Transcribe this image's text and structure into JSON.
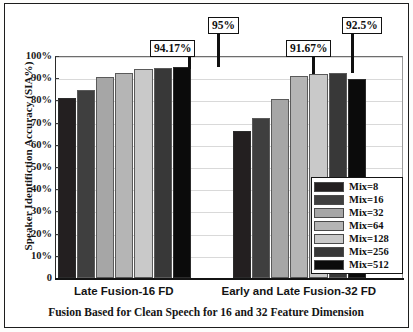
{
  "chart_data": {
    "type": "bar",
    "title": "",
    "xlabel": "Fusion Based for Clean Speech for 16 and 32 Feature Dimension",
    "ylabel": "Speaker Identifiction Accuracy (SIA%)",
    "categories": [
      "Late Fusion-16 FD",
      "Early and Late Fusion-32 FD"
    ],
    "series": [
      {
        "name": "Mix=8",
        "values": [
          81,
          66
        ]
      },
      {
        "name": "Mix=16",
        "values": [
          84.5,
          72
        ]
      },
      {
        "name": "Mix=32",
        "values": [
          90.5,
          80.5
        ]
      },
      {
        "name": "Mix=64",
        "values": [
          92.5,
          91.17
        ]
      },
      {
        "name": "Mix=128",
        "values": [
          94.17,
          92
        ]
      },
      {
        "name": "Mix=256",
        "values": [
          94.5,
          92.5
        ]
      },
      {
        "name": "Mix=512",
        "values": [
          95,
          89.5
        ]
      }
    ],
    "ylim": [
      0,
      100
    ],
    "ytick_labels": [
      "0",
      "10%",
      "20%",
      "30%",
      "40%",
      "50%",
      "60%",
      "70%",
      "80%",
      "90%",
      "100%"
    ],
    "ytick_values": [
      0,
      10,
      20,
      30,
      40,
      50,
      60,
      70,
      80,
      90,
      100
    ],
    "grid": true,
    "legend_position": "bottom-right",
    "bar_colors": [
      "#231f20",
      "#3f3f3f",
      "#a6a6a6",
      "#b5b5b5",
      "#c9c9c9",
      "#383838",
      "#0b0b0b"
    ],
    "annotations": [
      {
        "text": "94.17%",
        "series": "Mix=128",
        "category": "Late Fusion-16 FD",
        "value": 94.17
      },
      {
        "text": "95%",
        "series": "Mix=512",
        "category": "Late Fusion-16 FD",
        "value": 95
      },
      {
        "text": "91.67%",
        "series": "Mix=64",
        "category": "Early and Late Fusion-32 FD",
        "value": 91.67
      },
      {
        "text": "92.5%",
        "series": "Mix=256",
        "category": "Early and Late Fusion-32 FD",
        "value": 92.5
      }
    ]
  },
  "legend": {
    "items": [
      {
        "label": "Mix=8"
      },
      {
        "label": "Mix=16"
      },
      {
        "label": "Mix=32"
      },
      {
        "label": "Mix=64"
      },
      {
        "label": "Mix=128"
      },
      {
        "label": "Mix=256"
      },
      {
        "label": "Mix=512"
      }
    ]
  },
  "axes": {
    "y_title": "Speaker Identifiction Accuracy (SIA%)",
    "x_title": "Fusion Based for Clean Speech for 16 and 32 Feature Dimension",
    "y_ticks": [
      "100%",
      "90%",
      "80%",
      "70%",
      "60%",
      "50%",
      "40%",
      "30%",
      "20%",
      "10%",
      "0"
    ],
    "categories": [
      "Late Fusion-16 FD",
      "Early and Late Fusion-32 FD"
    ]
  },
  "callouts": [
    {
      "text": "94.17%"
    },
    {
      "text": "95%"
    },
    {
      "text": "91.67%"
    },
    {
      "text": "92.5%"
    }
  ],
  "colors": {
    "frame": "#1d1d1d",
    "grid": "#d9d9d9",
    "text": "#141414"
  }
}
